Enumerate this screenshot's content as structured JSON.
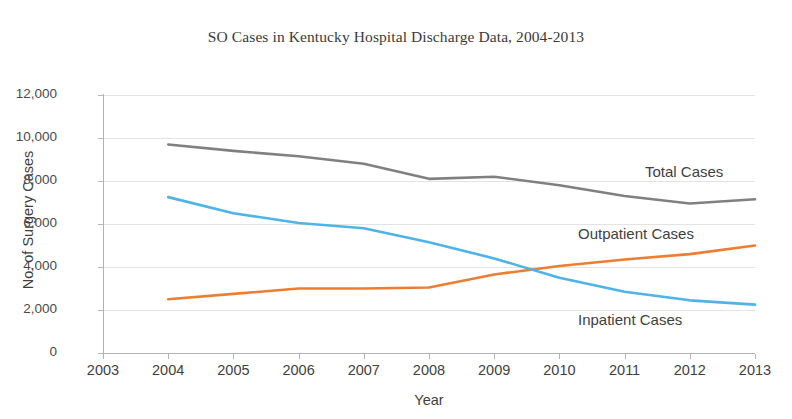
{
  "chart_data": {
    "type": "line",
    "title": "SO Cases in Kentucky Hospital Discharge Data, 2004-2013",
    "xlabel": "Year",
    "ylabel": "No. of Surgery Cases",
    "x": [
      2004,
      2005,
      2006,
      2007,
      2008,
      2009,
      2010,
      2011,
      2012,
      2013
    ],
    "xlim": [
      2003,
      2013
    ],
    "ylim": [
      0,
      12000
    ],
    "x_tick_labels": [
      "2003",
      "2004",
      "2005",
      "2006",
      "2007",
      "2008",
      "2009",
      "2010",
      "2011",
      "2012",
      "2013"
    ],
    "y_tick_labels": [
      "0",
      "2,000",
      "4,000",
      "6,000",
      "8,000",
      "10,000",
      "12,000"
    ],
    "y_ticks": [
      0,
      2000,
      4000,
      6000,
      8000,
      10000,
      12000
    ],
    "grid": true,
    "legend": "inline-labels-right",
    "series": [
      {
        "name": "Total Cases",
        "color": "#808080",
        "values": [
          9700,
          9400,
          9150,
          8800,
          8100,
          8200,
          7800,
          7300,
          6950,
          7150
        ]
      },
      {
        "name": "Outpatient Cases",
        "color": "#ED7D31",
        "values": [
          2500,
          2750,
          3000,
          3000,
          3050,
          3650,
          4050,
          4350,
          4600,
          5000
        ]
      },
      {
        "name": "Inpatient Cases",
        "color": "#4FB3E8",
        "values": [
          7250,
          6500,
          6050,
          5800,
          5150,
          4400,
          3500,
          2850,
          2450,
          2250
        ]
      }
    ]
  },
  "chart": {
    "title": "SO Cases in Kentucky Hospital Discharge Data, 2004-2013",
    "x_axis_title": "Year",
    "y_axis_title": "No. of Surgery Cases",
    "y_tick_labels": [
      "12,000",
      "10,000",
      "8,000",
      "6,000",
      "4,000",
      "2,000",
      "0"
    ],
    "x_tick_labels": [
      "2003",
      "2004",
      "2005",
      "2006",
      "2007",
      "2008",
      "2009",
      "2010",
      "2011",
      "2012",
      "2013"
    ],
    "series_labels": {
      "total": "Total Cases",
      "outpatient": "Outpatient Cases",
      "inpatient": "Inpatient Cases"
    },
    "colors": {
      "total": "#808080",
      "outpatient": "#ED7D31",
      "inpatient": "#4FB3E8",
      "gridline": "#E3E3E3",
      "axis": "#B3B3B3",
      "text": "#3F3F3F"
    }
  }
}
